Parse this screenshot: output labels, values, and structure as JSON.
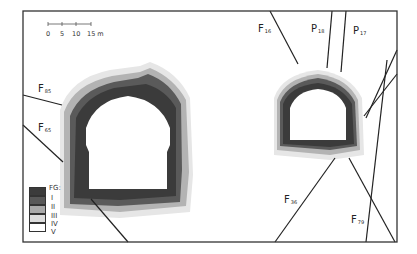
{
  "figure": {
    "type": "tunnel cross-section fracture-grade map",
    "scale_bar": {
      "ticks": [
        "0",
        "5",
        "10",
        "15 m"
      ]
    },
    "faults": [
      {
        "id": "F85",
        "prefix": "F",
        "sub": "85"
      },
      {
        "id": "F65",
        "prefix": "F",
        "sub": "65"
      },
      {
        "id": "F16",
        "prefix": "F",
        "sub": "16"
      },
      {
        "id": "P18",
        "prefix": "P",
        "sub": "18"
      },
      {
        "id": "P17",
        "prefix": "P",
        "sub": "17"
      },
      {
        "id": "F36",
        "prefix": "F",
        "sub": "36"
      },
      {
        "id": "F79",
        "prefix": "F",
        "sub": "79"
      }
    ],
    "legend": {
      "title": "FG:",
      "items": [
        {
          "label": "I",
          "color": "#3b3b3b"
        },
        {
          "label": "II",
          "color": "#585858"
        },
        {
          "label": "III",
          "color": "#a9a9a9"
        },
        {
          "label": "IV",
          "color": "#dcdcdc"
        },
        {
          "label": "V",
          "color": "#ffffff"
        }
      ]
    },
    "colors": {
      "frame": "#333333",
      "fault_line": "#222222"
    }
  }
}
